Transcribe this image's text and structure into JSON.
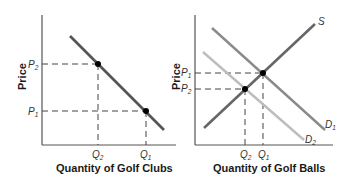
{
  "diagram": {
    "panels": [
      {
        "id": "golf-clubs",
        "y_axis_title": "Price",
        "x_axis_title": "Quantity of Golf Clubs",
        "y_ticks": [
          {
            "base": "P",
            "sub": "2"
          },
          {
            "base": "P",
            "sub": "1"
          }
        ],
        "x_ticks": [
          {
            "base": "Q",
            "sub": "2"
          },
          {
            "base": "Q",
            "sub": "1"
          }
        ],
        "curves": [
          {
            "name": "demand",
            "label": "",
            "color": "#555555"
          }
        ]
      },
      {
        "id": "golf-balls",
        "y_axis_title": "Price",
        "x_axis_title": "Quantity of Golf Balls",
        "y_ticks": [
          {
            "base": "P",
            "sub": "1"
          },
          {
            "base": "P",
            "sub": "2"
          }
        ],
        "x_ticks": [
          {
            "base": "Q",
            "sub": "2"
          },
          {
            "base": "Q",
            "sub": "1"
          }
        ],
        "curves": [
          {
            "name": "supply",
            "label": "S",
            "color": "#666666"
          },
          {
            "name": "demand-1",
            "label_base": "D",
            "label_sub": "1",
            "color": "#8a8a8a"
          },
          {
            "name": "demand-2",
            "label_base": "D",
            "label_sub": "2",
            "color": "#bdbdbd"
          }
        ]
      }
    ]
  },
  "colors": {
    "axis": "#555555",
    "dashed_guide": "#444444",
    "point": "#000000",
    "text": "#1a1a1a"
  }
}
